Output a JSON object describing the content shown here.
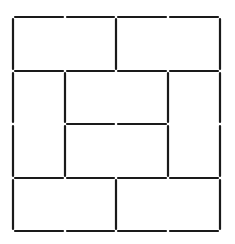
{
  "diagram": {
    "type": "matchstick-puzzle",
    "stick_color": "#1a1a1a",
    "background": "#ffffff",
    "gap": 2,
    "grid_x": [
      13,
      65,
      116,
      168,
      220
    ],
    "grid_y": [
      17,
      71,
      124,
      178,
      231
    ],
    "sticks": [
      {
        "x1": 13,
        "y1": 17,
        "x2": 65,
        "y2": 17
      },
      {
        "x1": 65,
        "y1": 17,
        "x2": 116,
        "y2": 17
      },
      {
        "x1": 116,
        "y1": 17,
        "x2": 168,
        "y2": 17
      },
      {
        "x1": 168,
        "y1": 17,
        "x2": 220,
        "y2": 17
      },
      {
        "x1": 13,
        "y1": 17,
        "x2": 13,
        "y2": 71
      },
      {
        "x1": 116,
        "y1": 17,
        "x2": 116,
        "y2": 71
      },
      {
        "x1": 220,
        "y1": 17,
        "x2": 220,
        "y2": 71
      },
      {
        "x1": 13,
        "y1": 71,
        "x2": 65,
        "y2": 71
      },
      {
        "x1": 65,
        "y1": 71,
        "x2": 116,
        "y2": 71
      },
      {
        "x1": 116,
        "y1": 71,
        "x2": 168,
        "y2": 71
      },
      {
        "x1": 168,
        "y1": 71,
        "x2": 220,
        "y2": 71
      },
      {
        "x1": 13,
        "y1": 71,
        "x2": 13,
        "y2": 124
      },
      {
        "x1": 65,
        "y1": 71,
        "x2": 65,
        "y2": 124
      },
      {
        "x1": 168,
        "y1": 71,
        "x2": 168,
        "y2": 124
      },
      {
        "x1": 220,
        "y1": 71,
        "x2": 220,
        "y2": 124
      },
      {
        "x1": 65,
        "y1": 124,
        "x2": 116,
        "y2": 124
      },
      {
        "x1": 116,
        "y1": 124,
        "x2": 168,
        "y2": 124
      },
      {
        "x1": 13,
        "y1": 124,
        "x2": 13,
        "y2": 178
      },
      {
        "x1": 65,
        "y1": 124,
        "x2": 65,
        "y2": 178
      },
      {
        "x1": 168,
        "y1": 124,
        "x2": 168,
        "y2": 178
      },
      {
        "x1": 220,
        "y1": 124,
        "x2": 220,
        "y2": 178
      },
      {
        "x1": 13,
        "y1": 178,
        "x2": 65,
        "y2": 178
      },
      {
        "x1": 65,
        "y1": 178,
        "x2": 116,
        "y2": 178
      },
      {
        "x1": 116,
        "y1": 178,
        "x2": 168,
        "y2": 178
      },
      {
        "x1": 168,
        "y1": 178,
        "x2": 220,
        "y2": 178
      },
      {
        "x1": 13,
        "y1": 178,
        "x2": 13,
        "y2": 231
      },
      {
        "x1": 116,
        "y1": 178,
        "x2": 116,
        "y2": 231
      },
      {
        "x1": 220,
        "y1": 178,
        "x2": 220,
        "y2": 231
      },
      {
        "x1": 13,
        "y1": 231,
        "x2": 65,
        "y2": 231
      },
      {
        "x1": 65,
        "y1": 231,
        "x2": 116,
        "y2": 231
      },
      {
        "x1": 116,
        "y1": 231,
        "x2": 168,
        "y2": 231
      },
      {
        "x1": 168,
        "y1": 231,
        "x2": 220,
        "y2": 231
      }
    ]
  }
}
